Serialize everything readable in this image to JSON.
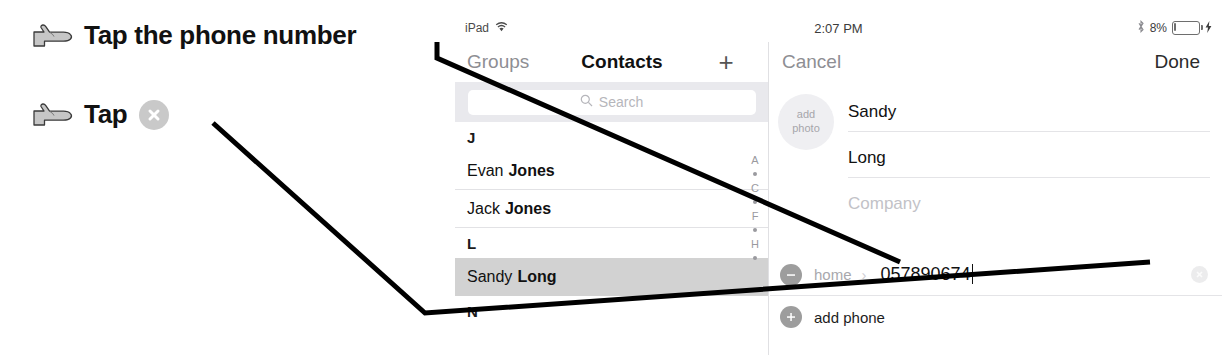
{
  "annotations": {
    "items": [
      {
        "hand_icon": "pointing-hand-icon",
        "text": "Tap the phone number",
        "has_clear_glyph": false
      },
      {
        "hand_icon": "pointing-hand-icon",
        "text": "Tap",
        "has_clear_glyph": true,
        "clear_glyph_icon": "clear-circle-x-icon"
      }
    ]
  },
  "device": {
    "status_bar": {
      "carrier": "iPad",
      "wifi_icon": "wifi-icon",
      "time": "2:07 PM",
      "bluetooth_icon": "bluetooth-icon",
      "battery_percent": "8%",
      "battery_icon": "battery-icon",
      "charging_icon": "charging-bolt-icon"
    },
    "nav_left": {
      "back_label": "Groups",
      "title": "Contacts",
      "add_icon": "plus-icon"
    },
    "nav_right": {
      "cancel_label": "Cancel",
      "done_label": "Done"
    },
    "master": {
      "search": {
        "icon": "search-icon",
        "placeholder": "Search",
        "value": ""
      },
      "sections": [
        {
          "letter": "J",
          "contacts": [
            {
              "first": "Evan",
              "last": "Jones",
              "selected": false
            },
            {
              "first": "Jack",
              "last": "Jones",
              "selected": false
            }
          ]
        },
        {
          "letter": "L",
          "contacts": [
            {
              "first": "Sandy",
              "last": "Long",
              "selected": true
            }
          ]
        },
        {
          "letter": "N",
          "contacts": []
        }
      ],
      "index_bar": [
        "A",
        "•",
        "C",
        "•",
        "F",
        "•",
        "H",
        "•"
      ]
    },
    "detail": {
      "photo": {
        "line1": "add",
        "line2": "photo"
      },
      "fields": [
        {
          "name": "first-name",
          "value": "Sandy",
          "placeholder": "First name",
          "is_placeholder": false
        },
        {
          "name": "last-name",
          "value": "Long",
          "placeholder": "Last name",
          "is_placeholder": false
        },
        {
          "name": "company",
          "value": "Company",
          "placeholder": "Company",
          "is_placeholder": true
        }
      ],
      "phone": {
        "remove_icon": "minus-circle-icon",
        "label": "home",
        "chevron_icon": "chevron-right-icon",
        "number": "057890674",
        "clear_icon": "clear-circle-x-icon"
      },
      "add_phone": {
        "add_icon": "plus-circle-icon",
        "label": "add phone"
      }
    }
  },
  "colors": {
    "ink": "#111111",
    "muted": "#8e8e93",
    "placeholder": "#c2c2c7",
    "selected_row": "#d2d2d2",
    "circle_gray": "#9d9d9d",
    "search_bg": "#e9e9ed",
    "leader_line": "#000000"
  }
}
